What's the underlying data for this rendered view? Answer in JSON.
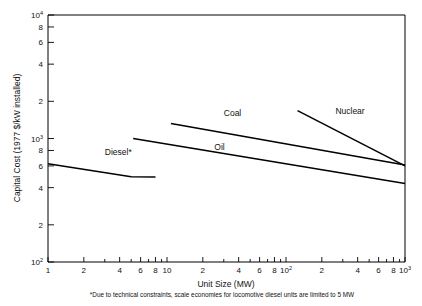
{
  "chart_data": {
    "type": "line",
    "title": "",
    "xlabel": "Unit Size (MW)",
    "ylabel": "Capital Cost (1977 $/kW installed)",
    "xscale": "log",
    "yscale": "log",
    "xlim": [
      1,
      1000
    ],
    "ylim": [
      100,
      10000
    ],
    "grid": false,
    "legend": "inline-labels",
    "footnote": "*Due to technical constraints, scale economies for locomotive diesel units are limited to 5 MW",
    "xticks": [
      {
        "value": 1,
        "label": "1"
      },
      {
        "value": 2,
        "label": "2"
      },
      {
        "value": 3,
        "label": ""
      },
      {
        "value": 4,
        "label": "4"
      },
      {
        "value": 5,
        "label": ""
      },
      {
        "value": 6,
        "label": "6"
      },
      {
        "value": 7,
        "label": ""
      },
      {
        "value": 8,
        "label": "8"
      },
      {
        "value": 9,
        "label": ""
      },
      {
        "value": 10,
        "label": "10"
      },
      {
        "value": 20,
        "label": "2"
      },
      {
        "value": 30,
        "label": ""
      },
      {
        "value": 40,
        "label": "4"
      },
      {
        "value": 50,
        "label": ""
      },
      {
        "value": 60,
        "label": "6"
      },
      {
        "value": 70,
        "label": ""
      },
      {
        "value": 80,
        "label": "8"
      },
      {
        "value": 90,
        "label": ""
      },
      {
        "value": 100,
        "label": "10",
        "exp": "2"
      },
      {
        "value": 200,
        "label": "2"
      },
      {
        "value": 300,
        "label": ""
      },
      {
        "value": 400,
        "label": "4"
      },
      {
        "value": 500,
        "label": ""
      },
      {
        "value": 600,
        "label": "6"
      },
      {
        "value": 700,
        "label": ""
      },
      {
        "value": 800,
        "label": "8"
      },
      {
        "value": 900,
        "label": ""
      },
      {
        "value": 1000,
        "label": "10",
        "exp": "3"
      }
    ],
    "yticks": [
      {
        "value": 10000,
        "label": "10",
        "exp": "4"
      },
      {
        "value": 8000,
        "label": "8"
      },
      {
        "value": 6000,
        "label": "6"
      },
      {
        "value": 4000,
        "label": "4"
      },
      {
        "value": 2000,
        "label": "2"
      },
      {
        "value": 1000,
        "label": "10",
        "exp": "3"
      },
      {
        "value": 800,
        "label": "8"
      },
      {
        "value": 600,
        "label": "6"
      },
      {
        "value": 400,
        "label": "4"
      },
      {
        "value": 200,
        "label": "2"
      },
      {
        "value": 100,
        "label": "10",
        "exp": "2"
      }
    ],
    "series": [
      {
        "name": "Diesel*",
        "label": "Diesel*",
        "label_x": 3.0,
        "label_y": 730,
        "points": [
          [
            1.0,
            625
          ],
          [
            5.0,
            490
          ],
          [
            8.0,
            487
          ]
        ]
      },
      {
        "name": "Oil",
        "label": "Oil",
        "label_x": 25,
        "label_y": 800,
        "points": [
          [
            5.2,
            1000
          ],
          [
            1000,
            432
          ]
        ]
      },
      {
        "name": "Coal",
        "label": "Coal",
        "label_x": 30,
        "label_y": 1520,
        "points": [
          [
            10.8,
            1320
          ],
          [
            1000,
            610
          ]
        ]
      },
      {
        "name": "Nuclear",
        "label": "Nuclear",
        "label_x": 260,
        "label_y": 1590,
        "points": [
          [
            125,
            1680
          ],
          [
            1000,
            600
          ]
        ]
      }
    ]
  }
}
